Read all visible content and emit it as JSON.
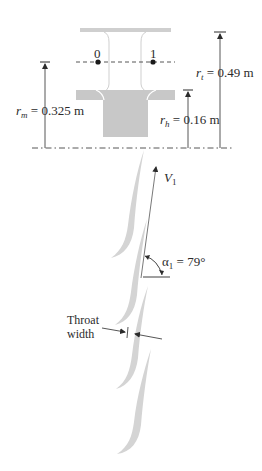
{
  "diagram": {
    "type": "turbine stage schematic",
    "stations": [
      {
        "id": "station-0",
        "label": "0"
      },
      {
        "id": "station-1",
        "label": "1"
      }
    ],
    "dimensions": {
      "mean_radius": {
        "symbol": "r",
        "subscript": "m",
        "value": "= 0.325 m"
      },
      "tip_radius": {
        "symbol": "r",
        "subscript": "t",
        "value": "= 0.49 m"
      },
      "hub_radius": {
        "symbol": "r",
        "subscript": "h",
        "value": "= 0.16 m"
      }
    },
    "velocity": {
      "symbol": "V",
      "subscript": "1"
    },
    "angle": {
      "symbol": "α",
      "subscript": "1",
      "value": "= 79°"
    },
    "throat": {
      "line1": "Throat",
      "line2": "width"
    }
  },
  "colors": {
    "ink": "#2b2b2b",
    "blade_fill": "#d4d4d4",
    "hub_fill": "#c8c8c8",
    "shroud_fill": "#cfcfcf"
  }
}
